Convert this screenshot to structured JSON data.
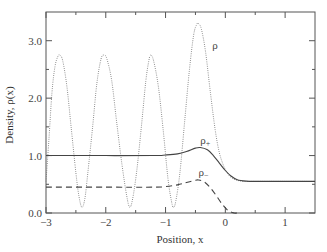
{
  "chart_data": {
    "type": "line",
    "title": "",
    "xlabel": "Position, x",
    "ylabel": "Density, ρ(x)",
    "xlim": [
      -3,
      1.5
    ],
    "ylim": [
      0,
      3.5
    ],
    "grid": false,
    "legend_position": "inline labels",
    "x_ticks": [
      -3,
      -2,
      -1,
      0,
      1
    ],
    "x_tick_labels": [
      "−3",
      "−2",
      "−1",
      "0",
      "1"
    ],
    "x_minor_ticks": [
      -2.5,
      -1.5,
      -0.5,
      0.5
    ],
    "y_ticks": [
      0,
      1,
      2,
      3
    ],
    "y_tick_labels": [
      "0.0",
      "1.0",
      "2.0",
      "3.0"
    ],
    "y_minor_ticks": [
      0.5,
      1.5,
      2.5
    ],
    "series": [
      {
        "name": "ρ",
        "label": "ρ",
        "style": "dotted",
        "label_pos": [
          -0.22,
          2.85
        ],
        "x": [
          -3.0,
          -2.95,
          -2.9,
          -2.85,
          -2.8,
          -2.77,
          -2.72,
          -2.65,
          -2.58,
          -2.5,
          -2.45,
          -2.4,
          -2.35,
          -2.3,
          -2.22,
          -2.15,
          -2.08,
          -2.03,
          -1.98,
          -1.9,
          -1.82,
          -1.73,
          -1.65,
          -1.6,
          -1.55,
          -1.48,
          -1.4,
          -1.33,
          -1.28,
          -1.25,
          -1.2,
          -1.12,
          -1.04,
          -0.96,
          -0.9,
          -0.87,
          -0.83,
          -0.76,
          -0.68,
          -0.6,
          -0.53,
          -0.48,
          -0.45,
          -0.4,
          -0.33,
          -0.25,
          -0.17,
          -0.1,
          -0.02,
          0.05,
          0.12,
          0.2,
          0.3,
          0.5,
          1.0,
          1.5
        ],
        "y": [
          0.55,
          1.3,
          2.1,
          2.55,
          2.73,
          2.75,
          2.65,
          2.2,
          1.5,
          0.7,
          0.3,
          0.1,
          0.25,
          0.7,
          1.5,
          2.25,
          2.68,
          2.75,
          2.68,
          2.3,
          1.6,
          0.85,
          0.3,
          0.1,
          0.25,
          0.75,
          1.55,
          2.3,
          2.65,
          2.75,
          2.65,
          2.2,
          1.45,
          0.6,
          0.2,
          0.1,
          0.2,
          0.7,
          1.6,
          2.5,
          3.1,
          3.28,
          3.3,
          3.2,
          2.8,
          2.1,
          1.45,
          1.05,
          0.8,
          0.67,
          0.6,
          0.57,
          0.55,
          0.55,
          0.55,
          0.55
        ]
      },
      {
        "name": "ρ+",
        "label": "ρ+",
        "style": "solid",
        "label_pos": [
          -0.42,
          1.2
        ],
        "x": [
          -3.0,
          -2.0,
          -1.2,
          -1.0,
          -0.8,
          -0.65,
          -0.5,
          -0.42,
          -0.3,
          -0.2,
          -0.1,
          0.0,
          0.1,
          0.2,
          0.35,
          0.5,
          1.0,
          1.5
        ],
        "y": [
          1.0,
          1.0,
          1.0,
          1.01,
          1.03,
          1.07,
          1.13,
          1.14,
          1.1,
          1.0,
          0.87,
          0.74,
          0.64,
          0.58,
          0.555,
          0.55,
          0.55,
          0.55
        ]
      },
      {
        "name": "ρ−",
        "label": "ρ−",
        "style": "dashed",
        "label_pos": [
          -0.45,
          0.65
        ],
        "x": [
          -3.0,
          -2.0,
          -1.2,
          -1.0,
          -0.8,
          -0.65,
          -0.5,
          -0.45,
          -0.35,
          -0.25,
          -0.15,
          -0.05,
          0.05,
          0.15,
          0.2
        ],
        "y": [
          0.45,
          0.45,
          0.45,
          0.46,
          0.49,
          0.53,
          0.57,
          0.575,
          0.54,
          0.44,
          0.3,
          0.15,
          0.04,
          0.0,
          0.0
        ]
      }
    ]
  }
}
